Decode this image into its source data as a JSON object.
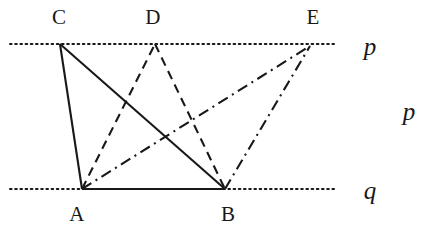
{
  "figure": {
    "width": 427,
    "height": 228,
    "background_color": "#ffffff",
    "ink_color": "#18181a"
  },
  "guide_lines": [
    {
      "id": "line-p",
      "label": "p",
      "style": "dotted",
      "orientation": "horizontal",
      "y": 44,
      "x_start": 10,
      "x_end": 337,
      "label_x": 370,
      "label_y": 46
    },
    {
      "id": "line-q",
      "label": "q",
      "style": "dotted",
      "orientation": "horizontal",
      "y": 189,
      "x_start": 10,
      "x_end": 337,
      "label_x": 370,
      "label_y": 190
    }
  ],
  "extra_labels": [
    {
      "id": "label-p-right",
      "text": "p",
      "x": 409,
      "y": 111
    }
  ],
  "points": [
    {
      "id": "A",
      "label": "A",
      "x": 82,
      "y": 189,
      "on_line": "q",
      "label_x": 77,
      "label_y": 214
    },
    {
      "id": "B",
      "label": "B",
      "x": 225,
      "y": 189,
      "on_line": "q",
      "label_x": 228,
      "label_y": 214
    },
    {
      "id": "C",
      "label": "C",
      "x": 60,
      "y": 44,
      "on_line": "p",
      "label_x": 59,
      "label_y": 17
    },
    {
      "id": "D",
      "label": "D",
      "x": 155,
      "y": 44,
      "on_line": "p",
      "label_x": 153,
      "label_y": 17
    },
    {
      "id": "E",
      "label": "E",
      "x": 310,
      "y": 46,
      "on_line": "p",
      "label_x": 313,
      "label_y": 17
    }
  ],
  "edges": [
    {
      "id": "edge-CA",
      "from": "C",
      "to": "A",
      "style": "solid",
      "x1": 60,
      "y1": 44,
      "x2": 82,
      "y2": 189
    },
    {
      "id": "edge-CB",
      "from": "C",
      "to": "B",
      "style": "solid",
      "x1": 60,
      "y1": 44,
      "x2": 225,
      "y2": 189
    },
    {
      "id": "edge-AB",
      "from": "A",
      "to": "B",
      "style": "solid",
      "x1": 82,
      "y1": 189,
      "x2": 225,
      "y2": 189
    },
    {
      "id": "edge-AD",
      "from": "A",
      "to": "D",
      "style": "dashed",
      "x1": 82,
      "y1": 189,
      "x2": 155,
      "y2": 44
    },
    {
      "id": "edge-DB",
      "from": "D",
      "to": "B",
      "style": "dashed",
      "x1": 155,
      "y1": 44,
      "x2": 225,
      "y2": 189
    },
    {
      "id": "edge-AE",
      "from": "A",
      "to": "E",
      "style": "dash-dot",
      "x1": 82,
      "y1": 189,
      "x2": 310,
      "y2": 46
    },
    {
      "id": "edge-BE",
      "from": "B",
      "to": "E",
      "style": "dash-dot",
      "x1": 225,
      "y1": 189,
      "x2": 310,
      "y2": 46
    }
  ],
  "stroke_styles": {
    "solid": {
      "dasharray": "",
      "width": 2.1
    },
    "dashed": {
      "dasharray": "9 6",
      "width": 2.1
    },
    "dash-dot": {
      "dasharray": "11 5 2 5",
      "width": 2.1
    },
    "dotted": {
      "dasharray": "1.6 3.6",
      "width": 2.0
    }
  }
}
